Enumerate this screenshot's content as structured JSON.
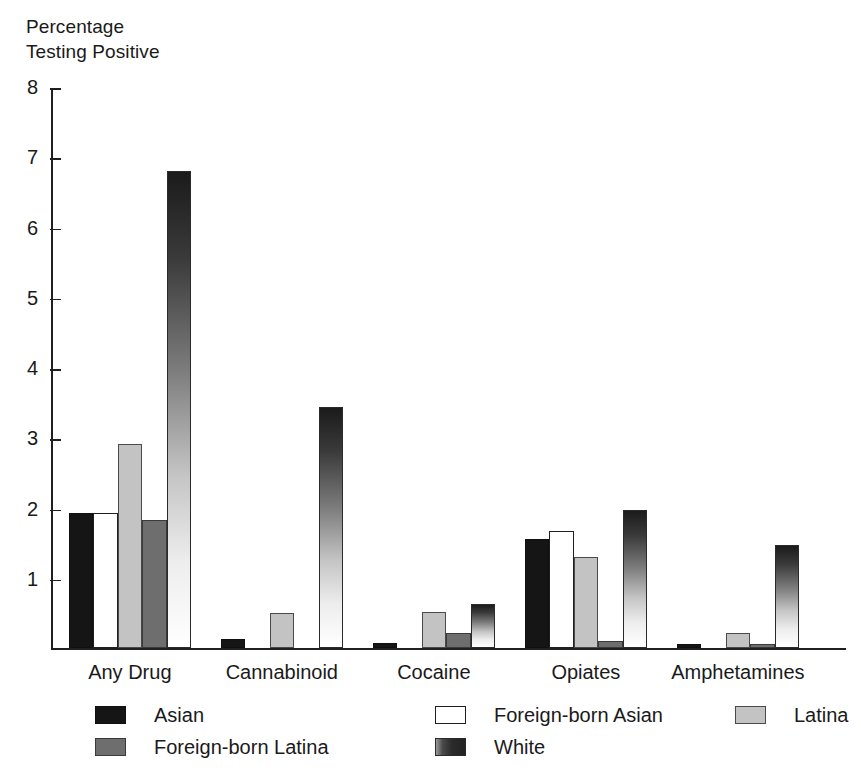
{
  "chart_data": {
    "type": "bar",
    "title": "",
    "ylabel": "Percentage\nTesting Positive",
    "xlabel": "",
    "ylim": [
      0,
      8
    ],
    "yticks": [
      1,
      2,
      3,
      4,
      5,
      6,
      7,
      8
    ],
    "ytick_labels": [
      "1",
      "2",
      "3",
      "4",
      "5",
      "6",
      "7",
      "8"
    ],
    "grid": false,
    "legend_position": "bottom",
    "categories": [
      "Any Drug",
      "Cannabinoid",
      "Cocaine",
      "Opiates",
      "Amphetamines"
    ],
    "series": [
      {
        "name": "Asian",
        "key": "s-asian",
        "color": "#151515",
        "values": [
          1.93,
          0.13,
          0.08,
          1.56,
          0.07
        ]
      },
      {
        "name": "Foreign-born Asian",
        "key": "s-fb-asian",
        "color": "#ffffff",
        "values": [
          1.93,
          0.0,
          0.0,
          1.68,
          0.0
        ]
      },
      {
        "name": "Latina",
        "key": "s-latina",
        "color": "#c3c3c3",
        "values": [
          2.92,
          0.5,
          0.52,
          1.3,
          0.22
        ]
      },
      {
        "name": "Foreign-born Latina",
        "key": "s-fb-latina",
        "color": "#6e6e6e",
        "values": [
          1.83,
          0.0,
          0.22,
          0.11,
          0.06
        ]
      },
      {
        "name": "White",
        "key": "s-white",
        "color": "gradient-dark-to-white",
        "values": [
          6.82,
          3.44,
          0.64,
          1.97,
          1.48
        ]
      }
    ]
  },
  "legend": {
    "entries": [
      {
        "label": "Asian",
        "key": "s-asian",
        "col": 0,
        "row": 0
      },
      {
        "label": "Foreign-born Latina",
        "key": "s-fb-latina",
        "col": 0,
        "row": 1
      },
      {
        "label": "Foreign-born Asian",
        "key": "s-fb-asian",
        "col": 1,
        "row": 0
      },
      {
        "label": "White",
        "key": "s-white",
        "col": 1,
        "row": 1
      },
      {
        "label": "Latina",
        "key": "s-latina",
        "col": 2,
        "row": 0
      }
    ]
  }
}
